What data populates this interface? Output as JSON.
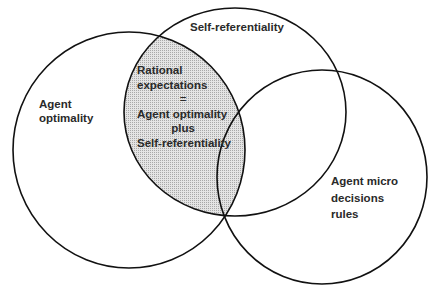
{
  "diagram": {
    "type": "venn",
    "sets": [
      {
        "id": "A",
        "label_lines": [
          "Agent",
          "optimality"
        ]
      },
      {
        "id": "B",
        "label_lines": [
          "Self-referentiality"
        ]
      },
      {
        "id": "C",
        "label_lines": [
          "Agent micro",
          "decisions",
          "rules"
        ]
      }
    ],
    "intersection_AB": {
      "shaded": true,
      "label_lines": [
        "Rational",
        "expectations",
        "=",
        "Agent optimality",
        "plus",
        "Self-referentiality"
      ]
    },
    "colors": {
      "stroke": "#111111",
      "shade": "#d0d0d0",
      "background": "#ffffff"
    }
  }
}
